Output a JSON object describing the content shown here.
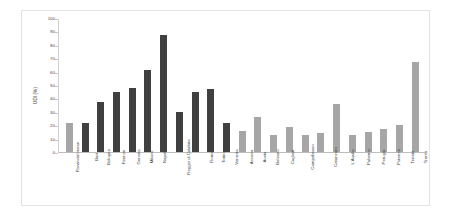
{
  "chart_data": {
    "type": "bar",
    "title": "",
    "xlabel": "",
    "ylabel": "UDI (%)",
    "ylabel_lines": [
      "UDI",
      "(%)"
    ],
    "ylim": [
      0,
      100
    ],
    "yticks": [
      0,
      10,
      20,
      30,
      40,
      50,
      60,
      70,
      80,
      90,
      100
    ],
    "grid": false,
    "legend": "none",
    "categories": [
      "Provincial mean",
      "Bari",
      "Bologna",
      "Firenze",
      "Genova",
      "Milano",
      "Napoli",
      "Reggio di Calabria",
      "Roma",
      "Torino",
      "Venezia",
      "Ancona",
      "Aosta",
      "Bolzano",
      "Cagliari",
      "Campobasso",
      "Catanzaro",
      "L'Aquila",
      "Palermo",
      "Perugia",
      "Potenza",
      "Trieste",
      "Trento"
    ],
    "values": [
      22,
      22,
      37,
      45,
      48,
      61,
      87,
      30,
      45,
      47,
      22,
      16,
      26,
      13,
      19,
      13,
      14,
      36,
      13,
      15,
      17,
      20,
      67
    ],
    "bar_colors": [
      "#a6a6a6",
      "#404040",
      "#404040",
      "#404040",
      "#404040",
      "#404040",
      "#404040",
      "#404040",
      "#404040",
      "#404040",
      "#404040",
      "#a6a6a6",
      "#a6a6a6",
      "#a6a6a6",
      "#a6a6a6",
      "#a6a6a6",
      "#a6a6a6",
      "#a6a6a6",
      "#a6a6a6",
      "#a6a6a6",
      "#a6a6a6",
      "#a6a6a6",
      "#a6a6a6"
    ]
  },
  "style": {
    "frame_color": "#e3e3e3",
    "axis_color": "#bdbdbd",
    "tick_text_color": "#4a4a4a",
    "label_text_color": "#3c3c3c",
    "background": "#ffffff",
    "dark_bar": "#404040",
    "gray_bar": "#a6a6a6"
  }
}
